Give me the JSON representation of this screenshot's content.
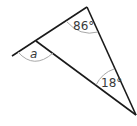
{
  "diagram": {
    "type": "triangle-angles",
    "angles": {
      "top": "86°",
      "bottom_right": "18°",
      "exterior_left": "a"
    },
    "colors": {
      "line": "#1a1a1a",
      "arc": "#a8a8a8",
      "text": "#3a3a3a"
    }
  }
}
